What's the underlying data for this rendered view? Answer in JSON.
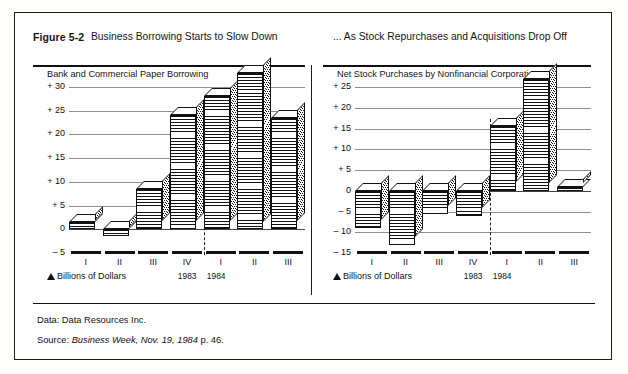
{
  "figure": {
    "number": "Figure 5-2",
    "title_left": "Business Borrowing Starts to Slow Down",
    "title_right": "... As Stock Repurchases and  Acquisitions Drop Off"
  },
  "footer": {
    "data_label": "Data: Data Resources Inc.",
    "source_prefix": "Source: ",
    "source_italic": "Business Week, Nov. 19, 1984",
    "source_suffix": " p. 46."
  },
  "axis_units_label": "Billions of Dollars",
  "year_labels": {
    "first": "1983",
    "second": "1984"
  },
  "chart_data": [
    {
      "type": "bar",
      "id": "left",
      "title": "Bank and Commercial Paper Borrowing",
      "subtitle": "Bank and Commercial Paper Borrowing",
      "xlabel": "Billions of Dollars",
      "ylabel": "",
      "ylim": [
        -5,
        35
      ],
      "grid": true,
      "legend": "none",
      "ticks": [
        "+ 30",
        "+ 25",
        "+ 20",
        "+ 15",
        "+ 10",
        "+ 5",
        "0",
        "– 5"
      ],
      "tick_values": [
        30,
        25,
        20,
        15,
        10,
        5,
        0,
        -5
      ],
      "categories": [
        "I",
        "II",
        "III",
        "IV",
        "I",
        "II",
        "III"
      ],
      "category_years": [
        "1983",
        "1983",
        "1983",
        "1983",
        "1984",
        "1984",
        "1984"
      ],
      "values": [
        1.5,
        -1.5,
        8.5,
        24.0,
        28.0,
        33.0,
        23.5
      ]
    },
    {
      "type": "bar",
      "id": "right",
      "title": "Net Stock Purchases by Nonfinancial Corporations",
      "subtitle": "Net Stock Purchases by  Nonfinancial Corporations",
      "xlabel": "Billions of Dollars",
      "ylabel": "",
      "ylim": [
        -15,
        28
      ],
      "grid": true,
      "legend": "none",
      "ticks": [
        "+ 25",
        "+ 20",
        "+ 15",
        "+ 10",
        "+ 5",
        "0",
        "– 5",
        "– 10",
        "– 15"
      ],
      "tick_values": [
        25,
        20,
        15,
        10,
        5,
        0,
        -5,
        -10,
        -15
      ],
      "categories": [
        "I",
        "II",
        "III",
        "IV",
        "I",
        "II",
        "III"
      ],
      "category_years": [
        "1983",
        "1983",
        "1983",
        "1983",
        "1984",
        "1984",
        "1984"
      ],
      "values": [
        -9.0,
        -13.0,
        -5.5,
        -6.0,
        15.5,
        27.0,
        1.0
      ]
    }
  ]
}
